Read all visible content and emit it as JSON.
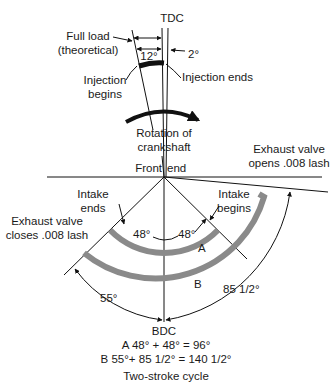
{
  "diagram": {
    "top_clipped_text": "Two-stroke cycle",
    "labels": {
      "tdc": "TDC",
      "full_load_1": "Full load",
      "full_load_2": "(theoretical)",
      "deg12": "12°",
      "deg2": "2°",
      "injection_begins_1": "Injection",
      "injection_begins_2": "begins",
      "injection_ends": "Injection ends",
      "rotation_1": "Rotation of",
      "rotation_2": "crankshaft",
      "front": "Front",
      "end": "end",
      "exhaust_opens_1": "Exhaust valve",
      "exhaust_opens_2": "opens .008 lash",
      "intake_ends_1": "Intake",
      "intake_ends_2": "ends",
      "intake_begins_1": "Intake",
      "intake_begins_2": "begins",
      "exhaust_closes_1": "Exhaust valve",
      "exhaust_closes_2": "closes .008 lash",
      "deg48_left": "48°",
      "deg48_right": "48°",
      "arc_a": "A",
      "arc_b": "B",
      "deg55": "55°",
      "deg85": "85 1/2°",
      "bdc": "BDC",
      "formula_a": "A 48° + 48° = 96°",
      "formula_b": "B 55°+ 85 1/2° = 140 1/2°",
      "caption": "Two-stroke cycle"
    },
    "colors": {
      "line": "#111111",
      "arc": "#8a8a8a",
      "text": "#1a1a1a"
    }
  }
}
